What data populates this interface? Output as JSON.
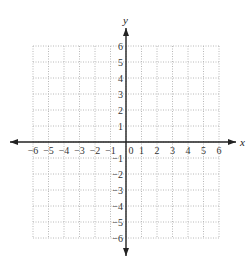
{
  "chart_data": {
    "type": "coordinate-grid",
    "title": "",
    "xlabel": "x",
    "ylabel": "y",
    "xlim": [
      -6,
      6
    ],
    "ylim": [
      -6,
      6
    ],
    "grid": true,
    "grid_style": "dotted",
    "x_ticks": [
      "−6",
      "−5",
      "−4",
      "−3",
      "−2",
      "−1",
      "0",
      "1",
      "2",
      "3",
      "4",
      "5",
      "6"
    ],
    "y_ticks_positive": [
      "1",
      "2",
      "3",
      "4",
      "5",
      "6"
    ],
    "y_ticks_negative": [
      "−1",
      "−2",
      "−3",
      "−4",
      "−5",
      "−6"
    ],
    "origin_label": "0",
    "points": []
  },
  "colors": {
    "axis": "#222222",
    "grid": "#b8b8b8",
    "text": "#333333"
  }
}
